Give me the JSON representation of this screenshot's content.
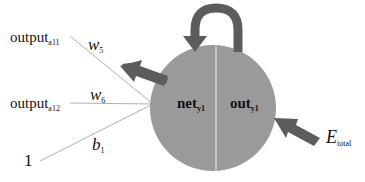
{
  "diagram": {
    "inputs": [
      {
        "label": "output",
        "subscript": "a11",
        "weight": "w",
        "weight_sub": "5"
      },
      {
        "label": "output",
        "subscript": "a12",
        "weight": "w",
        "weight_sub": "6"
      },
      {
        "label": "1",
        "subscript": "",
        "weight": "b",
        "weight_sub": "1"
      }
    ],
    "neuron": {
      "left_label": "net",
      "left_sub": "y1",
      "right_label": "out",
      "right_sub": "y1"
    },
    "error": {
      "label": "E",
      "subscript": "total"
    },
    "colors": {
      "neuron_fill": "#9a9a9a",
      "arrow_fill": "#5c5c5c",
      "line": "#b0b0b0"
    }
  }
}
